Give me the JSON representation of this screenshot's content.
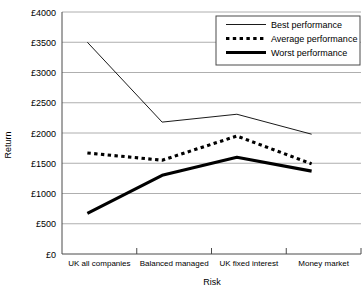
{
  "chart_data": {
    "type": "line",
    "title": "",
    "xlabel": "Risk",
    "ylabel": "Return",
    "categories": [
      "UK all companies",
      "Balanced managed",
      "UK fixed interest",
      "Money market"
    ],
    "series": [
      {
        "name": "Best performance",
        "values": [
          3500,
          2180,
          2310,
          1980
        ],
        "style": "thin-solid",
        "color": "#000000"
      },
      {
        "name": "Average performance",
        "values": [
          1670,
          1550,
          1950,
          1490
        ],
        "style": "thick-dotted",
        "color": "#000000"
      },
      {
        "name": "Worst performance",
        "values": [
          670,
          1300,
          1600,
          1370
        ],
        "style": "thick-solid",
        "color": "#000000"
      }
    ],
    "ylim": [
      0,
      4000
    ],
    "ytick_values": [
      0,
      500,
      1000,
      1500,
      2000,
      2500,
      3000,
      3500,
      4000
    ],
    "ytick_labels": [
      "£0",
      "£500",
      "£1000",
      "£1500",
      "£2000",
      "£2500",
      "£3000",
      "£3500",
      "£4000"
    ],
    "grid": true,
    "legend_position": "top-right"
  },
  "legend": {
    "items": [
      {
        "label": "Best performance"
      },
      {
        "label": "Average performance"
      },
      {
        "label": "Worst performance"
      }
    ]
  },
  "axes": {
    "y_title": "Return",
    "x_title": "Risk"
  }
}
